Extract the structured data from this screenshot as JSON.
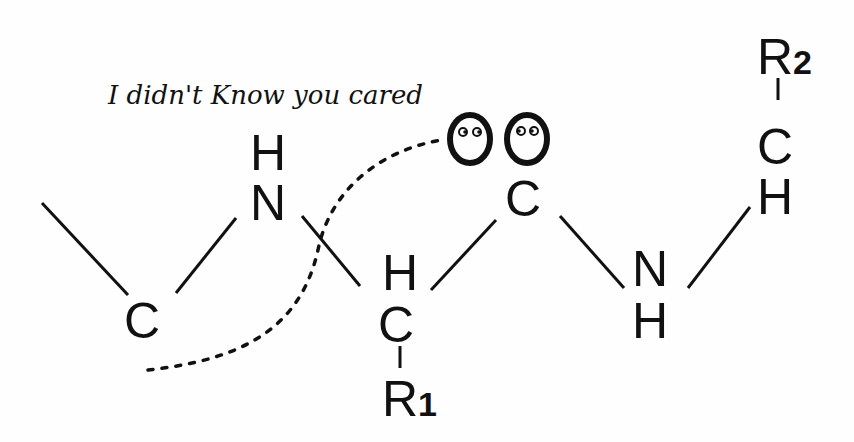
{
  "caption": "I didn't Know you cared",
  "atoms": {
    "c_left": "C",
    "n1": "N",
    "h_n1": "H",
    "c_alpha": "C",
    "h_alpha": "H",
    "r1_label": "R",
    "r1_sub": "1",
    "c_carbonyl": "C",
    "o1": "O",
    "o2": "O",
    "n2": "N",
    "h_n2": "H",
    "c2": "C",
    "h_c2": "H",
    "r2_label": "R",
    "r2_sub": "2"
  },
  "colors": {
    "ink": "#111111",
    "background": "#fefefe"
  }
}
